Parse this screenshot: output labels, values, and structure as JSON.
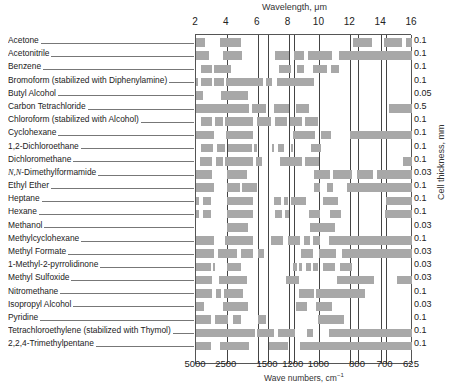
{
  "chart_data": {
    "type": "table",
    "top_axis": {
      "label": "Wavelength, μm",
      "ticks": [
        "2",
        "4",
        "6",
        "8",
        "10",
        "12",
        "14",
        "16"
      ],
      "range": [
        2,
        16
      ]
    },
    "bottom_axis": {
      "label": "Wave numbers, cm⁻¹",
      "ticks": [
        "5000",
        "2500",
        "1500",
        "1200",
        "1000",
        "800",
        "700",
        "625"
      ]
    },
    "right_axis": {
      "label": "Cell thickness, mm"
    },
    "grid_lines_um": [
      4,
      6,
      6.67,
      8,
      8.33,
      10,
      12,
      12.5,
      14,
      14.3
    ],
    "rows": [
      {
        "solvent": "Acetone",
        "thickness": "0.1",
        "bars": [
          [
            0,
            9
          ],
          [
            24,
            45
          ],
          [
            157,
            176
          ],
          [
            188,
            206
          ],
          [
            210,
            216
          ]
        ]
      },
      {
        "solvent": "Acetonitrile",
        "thickness": "0.1",
        "bars": [
          [
            0,
            13
          ],
          [
            27,
            46
          ],
          [
            79,
            93
          ],
          [
            98,
            108
          ],
          [
            112,
            136
          ],
          [
            143,
            216
          ]
        ]
      },
      {
        "solvent": "Benzene",
        "thickness": "0.1",
        "bars": [
          [
            5,
            16
          ],
          [
            18,
            35
          ],
          [
            83,
            95
          ],
          [
            101,
            108
          ],
          [
            117,
            131
          ],
          [
            135,
            143
          ]
        ]
      },
      {
        "solvent": "Bromoform (stabilized with Diphenylamine)",
        "thickness": "0.1",
        "bars": [
          [
            0,
            2
          ],
          [
            5,
            16
          ],
          [
            18,
            28
          ],
          [
            30,
            67
          ],
          [
            70,
            76
          ],
          [
            81,
            113
          ],
          [
            113,
            118
          ]
        ]
      },
      {
        "solvent": "Butyl Alcohol",
        "thickness": "0.05",
        "bars": [
          [
            0,
            7
          ],
          [
            25,
            52
          ]
        ]
      },
      {
        "solvent": "Carbon Tetrachloride",
        "thickness": "0.5",
        "bars": [
          [
            0,
            53
          ],
          [
            56,
            70
          ],
          [
            78,
            93
          ],
          [
            100,
            113
          ],
          [
            193,
            216
          ]
        ]
      },
      {
        "solvent": "Chloroform (stabilized with Alcohol)",
        "thickness": "0.1",
        "bars": [
          [
            5,
            16
          ],
          [
            19,
            27
          ],
          [
            29,
            57
          ],
          [
            61,
            75
          ],
          [
            79,
            91
          ],
          [
            94,
            106
          ],
          [
            109,
            122
          ]
        ]
      },
      {
        "solvent": "Cyclohexane",
        "thickness": "0.1",
        "bars": [
          [
            0,
            18
          ],
          [
            30,
            57
          ],
          [
            97,
            119
          ],
          [
            125,
            135
          ],
          [
            154,
            216
          ]
        ]
      },
      {
        "solvent": "1,2-Dichloroethane",
        "thickness": "0.1",
        "bars": [
          [
            5,
            17
          ],
          [
            21,
            29
          ],
          [
            32,
            56
          ],
          [
            58,
            61
          ],
          [
            76,
            78
          ],
          [
            82,
            88
          ],
          [
            95,
            97
          ],
          [
            115,
            125
          ]
        ]
      },
      {
        "solvent": "Dichloromethane",
        "thickness": "0.1",
        "bars": [
          [
            4,
            16
          ],
          [
            20,
            27
          ],
          [
            29,
            57
          ],
          [
            60,
            66
          ],
          [
            84,
            106
          ],
          [
            109,
            123
          ],
          [
            207,
            216
          ]
        ]
      },
      {
        "solvent": "N,N-Dimethylformamide",
        "thickness": "0.03",
        "bars": [
          [
            0,
            16
          ],
          [
            31,
            51
          ],
          [
            118,
            134
          ],
          [
            137,
            156
          ],
          [
            161,
            177
          ],
          [
            181,
            216
          ]
        ]
      },
      {
        "solvent": "Ethyl Ether",
        "thickness": "0.1",
        "bars": [
          [
            0,
            18
          ],
          [
            31,
            44
          ],
          [
            46,
            61
          ],
          [
            118,
            124
          ],
          [
            131,
            137
          ],
          [
            151,
            216
          ]
        ]
      },
      {
        "solvent": "Heptane",
        "thickness": "0.1",
        "bars": [
          [
            0,
            3
          ],
          [
            7,
            15
          ],
          [
            31,
            57
          ],
          [
            78,
            85
          ],
          [
            88,
            92
          ],
          [
            95,
            110
          ],
          [
            127,
            142
          ],
          [
            190,
            216
          ]
        ]
      },
      {
        "solvent": "Hexane",
        "thickness": "0.1",
        "bars": [
          [
            0,
            3
          ],
          [
            7,
            15
          ],
          [
            31,
            57
          ],
          [
            79,
            86
          ],
          [
            89,
            93
          ],
          [
            113,
            124
          ],
          [
            134,
            145
          ],
          [
            189,
            216
          ]
        ]
      },
      {
        "solvent": "Methanol",
        "thickness": "0.03",
        "bars": [
          [
            31,
            52
          ],
          [
            114,
            139
          ]
        ]
      },
      {
        "solvent": "Methylcyclohexane",
        "thickness": "0.1",
        "bars": [
          [
            0,
            18
          ],
          [
            29,
            57
          ],
          [
            75,
            87
          ],
          [
            92,
            104
          ],
          [
            108,
            114
          ],
          [
            117,
            124
          ],
          [
            133,
            216
          ]
        ]
      },
      {
        "solvent": "Methyl Formate",
        "thickness": "0.03",
        "bars": [
          [
            0,
            18
          ],
          [
            22,
            41
          ],
          [
            45,
            57
          ],
          [
            62,
            68
          ],
          [
            105,
            117
          ],
          [
            123,
            140
          ],
          [
            146,
            216
          ]
        ]
      },
      {
        "solvent": "1-Methyl-2-pyrrolidinone",
        "thickness": "0.03",
        "bars": [
          [
            0,
            15
          ],
          [
            17,
            19
          ],
          [
            31,
            45
          ],
          [
            97,
            101
          ],
          [
            103,
            106
          ],
          [
            110,
            115
          ],
          [
            117,
            122
          ],
          [
            127,
            139
          ],
          [
            144,
            156
          ]
        ]
      },
      {
        "solvent": "Methyl Sulfoxide",
        "thickness": "0.03",
        "bars": [
          [
            0,
            16
          ],
          [
            23,
            51
          ],
          [
            90,
            103
          ],
          [
            141,
            178
          ],
          [
            201,
            216
          ]
        ]
      },
      {
        "solvent": "Nitromethane",
        "thickness": "0.1",
        "bars": [
          [
            0,
            16
          ],
          [
            20,
            25
          ],
          [
            28,
            47
          ],
          [
            103,
            118
          ],
          [
            120,
            169
          ]
        ]
      },
      {
        "solvent": "Isopropyl Alcohol",
        "thickness": "0.03",
        "bars": [
          [
            0,
            8
          ],
          [
            27,
            52
          ],
          [
            100,
            111
          ],
          [
            120,
            136
          ]
        ]
      },
      {
        "solvent": "Pyridine",
        "thickness": "0.1",
        "bars": [
          [
            0,
            15
          ],
          [
            19,
            32
          ],
          [
            37,
            45
          ],
          [
            62,
            70
          ],
          [
            122,
            148
          ]
        ]
      },
      {
        "solvent": "Tetrachloroethylene (stabilized with Thymol)",
        "thickness": "0.1",
        "bars": [
          [
            0,
            59
          ],
          [
            61,
            78
          ],
          [
            82,
            99
          ],
          [
            111,
            117
          ],
          [
            133,
            216
          ]
        ]
      },
      {
        "solvent": "2,2,4-Trimethylpentane",
        "thickness": "0.1",
        "bars": [
          [
            0,
            15
          ],
          [
            24,
            53
          ],
          [
            73,
            92
          ],
          [
            104,
            216
          ]
        ]
      }
    ]
  },
  "header": {
    "wavelength_label": "Wavelength, μm"
  },
  "footer": {
    "wavenumber_label_main": "Wave numbers, cm",
    "wavenumber_label_sup": "−1"
  },
  "right": {
    "thickness_label": "Cell thickness, mm"
  },
  "labels": [
    {
      "text": "Acetone"
    },
    {
      "text": "Acetonitrile"
    },
    {
      "text": "Benzene"
    },
    {
      "text": "Bromoform (stabilized with Diphenylamine)"
    },
    {
      "text": "Butyl Alcohol"
    },
    {
      "text": "Carbon Tetrachloride"
    },
    {
      "text": "Chloroform (stabilized with Alcohol)"
    },
    {
      "text": "Cyclohexane"
    },
    {
      "text": "1,2-Dichloroethane"
    },
    {
      "text": "Dichloromethane"
    },
    {
      "italic_prefix": "N,N-",
      "text": "Dimethylformamide"
    },
    {
      "text": "Ethyl Ether"
    },
    {
      "text": "Heptane"
    },
    {
      "text": "Hexane"
    },
    {
      "text": "Methanol"
    },
    {
      "text": "Methylcyclohexane"
    },
    {
      "text": "Methyl Formate"
    },
    {
      "text": "1-Methyl-2-pyrrolidinone"
    },
    {
      "text": "Methyl Sulfoxide"
    },
    {
      "text": "Nitromethane"
    },
    {
      "text": "Isopropyl  Alcohol"
    },
    {
      "text": "Pyridine"
    },
    {
      "text": "Tetrachloroethylene (stabilized with Thymol)"
    },
    {
      "text": "2,2,4-Trimethylpentane"
    }
  ],
  "colors": {
    "bar": "#a8a8a8",
    "grid": "#444444",
    "text": "#222222"
  }
}
